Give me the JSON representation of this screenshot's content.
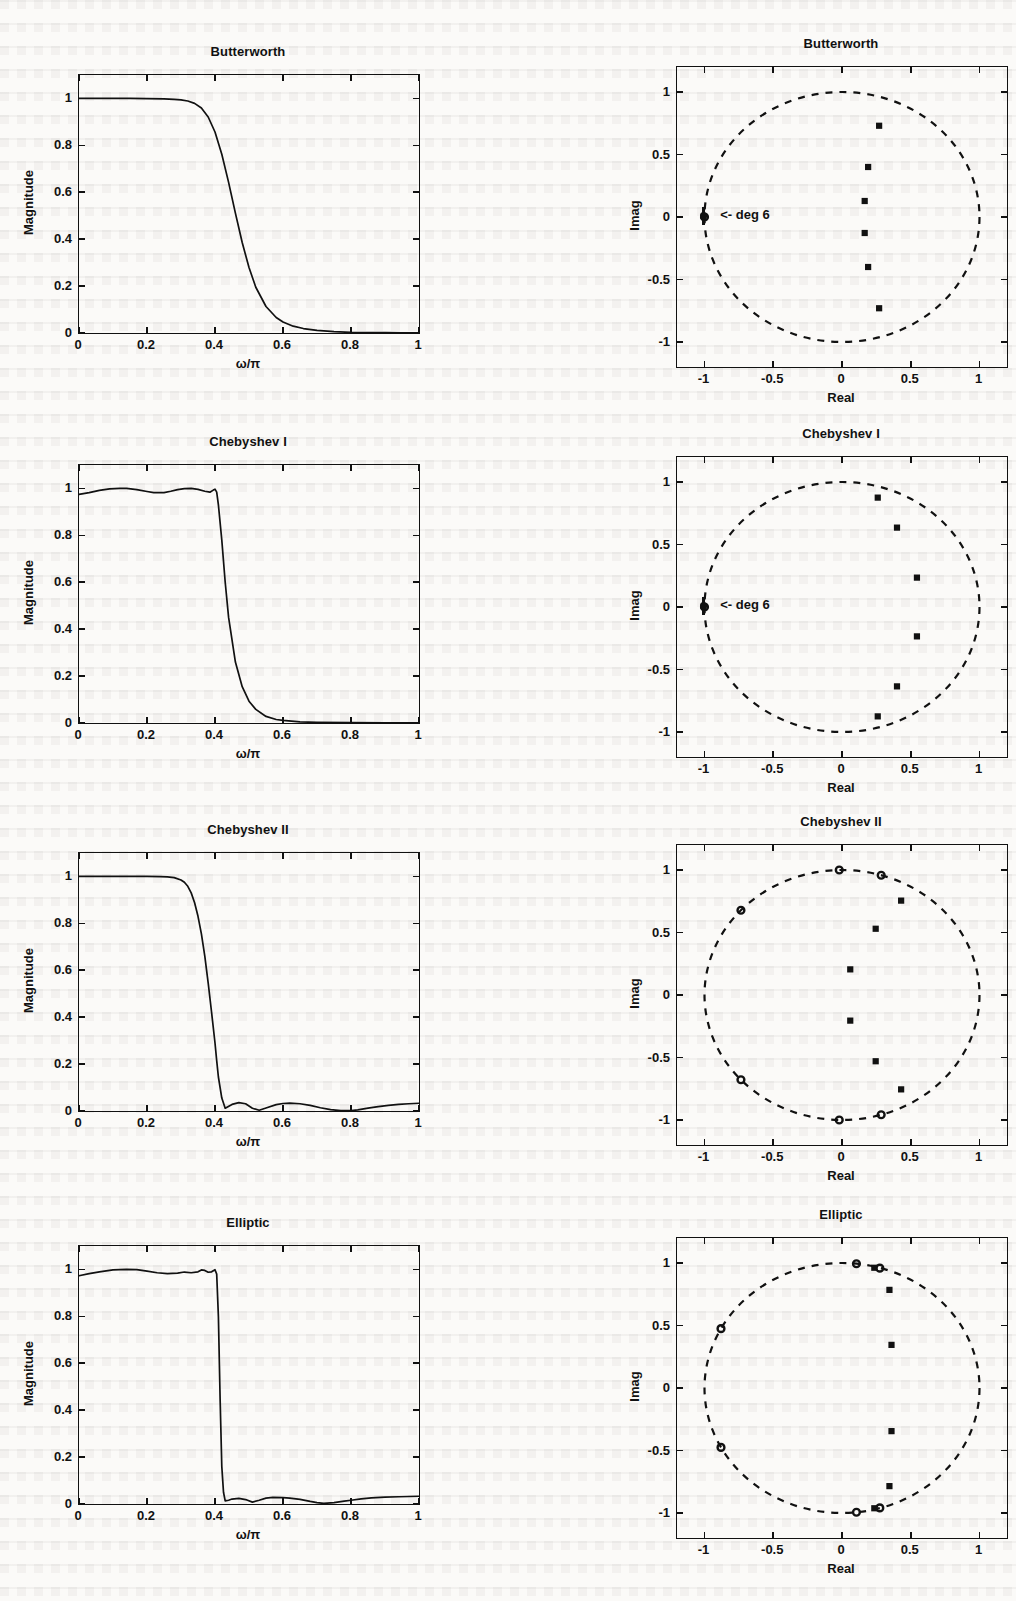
{
  "figure": {
    "kind": "filter-comparison-figure",
    "rows": 4,
    "cols": 2
  },
  "labels": {
    "magnitude_axis": "Magnitude",
    "omega_axis": "ω/π",
    "real_axis": "Real",
    "imag_axis": "Imag",
    "deg_annotation": "<- deg 6"
  },
  "chart_data": [
    {
      "type": "line",
      "title": "Butterworth",
      "panel": "magnitude",
      "xlabel": "ω/π",
      "ylabel": "Magnitude",
      "xlim": [
        0,
        1
      ],
      "ylim": [
        0,
        1.1
      ],
      "xticks": [
        "0",
        "0.2",
        "0.4",
        "0.6",
        "0.8",
        "1"
      ],
      "xtickvals": [
        0,
        0.2,
        0.4,
        0.6,
        0.8,
        1
      ],
      "yticks": [
        "0",
        "0.2",
        "0.4",
        "0.6",
        "0.8",
        "1"
      ],
      "ytickvals": [
        0,
        0.2,
        0.4,
        0.6,
        0.8,
        1
      ],
      "grid": false,
      "legend": "none",
      "x": [
        0,
        0.05,
        0.1,
        0.15,
        0.2,
        0.25,
        0.28,
        0.3,
        0.32,
        0.34,
        0.36,
        0.38,
        0.4,
        0.42,
        0.44,
        0.46,
        0.48,
        0.5,
        0.52,
        0.55,
        0.58,
        0.6,
        0.63,
        0.66,
        0.7,
        0.75,
        0.8,
        0.85,
        0.9,
        0.95,
        1
      ],
      "y": [
        1.0,
        1.0,
        1.0,
        1.0,
        0.999,
        0.998,
        0.996,
        0.994,
        0.989,
        0.979,
        0.959,
        0.921,
        0.857,
        0.762,
        0.642,
        0.511,
        0.386,
        0.279,
        0.195,
        0.113,
        0.066,
        0.047,
        0.029,
        0.019,
        0.011,
        0.006,
        0.003,
        0.002,
        0.002,
        0.001,
        0.001
      ]
    },
    {
      "type": "scatter",
      "title": "Butterworth",
      "panel": "pole-zero",
      "xlabel": "Real",
      "ylabel": "Imag",
      "xlim": [
        -1.2,
        1.2
      ],
      "ylim": [
        -1.2,
        1.2
      ],
      "xticks": [
        "-1",
        "-0.5",
        "0",
        "0.5",
        "1"
      ],
      "xtickvals": [
        -1,
        -0.5,
        0,
        0.5,
        1
      ],
      "yticks": [
        "1",
        "0.5",
        "0",
        "-0.5",
        "-1"
      ],
      "ytickvals": [
        1,
        0.5,
        0,
        -0.5,
        -1
      ],
      "unit_circle": true,
      "grid": false,
      "legend": "none",
      "annotation": "<- deg 6",
      "annotation_at": [
        -0.98,
        0.0
      ],
      "poles": [
        [
          0.27,
          0.73
        ],
        [
          0.27,
          -0.73
        ],
        [
          0.19,
          0.4
        ],
        [
          0.19,
          -0.4
        ],
        [
          0.165,
          0.128
        ],
        [
          0.165,
          -0.128
        ]
      ],
      "zeros": [
        [
          -1,
          0
        ]
      ],
      "zero_multiplicity": 6
    },
    {
      "type": "line",
      "title": "Chebyshev I",
      "panel": "magnitude",
      "xlabel": "ω/π",
      "ylabel": "Magnitude",
      "xlim": [
        0,
        1
      ],
      "ylim": [
        0,
        1.1
      ],
      "xticks": [
        "0",
        "0.2",
        "0.4",
        "0.6",
        "0.8",
        "1"
      ],
      "xtickvals": [
        0,
        0.2,
        0.4,
        0.6,
        0.8,
        1
      ],
      "yticks": [
        "0",
        "0.2",
        "0.4",
        "0.6",
        "0.8",
        "1"
      ],
      "ytickvals": [
        0,
        0.2,
        0.4,
        0.6,
        0.8,
        1
      ],
      "grid": false,
      "legend": "none",
      "x": [
        0,
        0.03,
        0.06,
        0.09,
        0.12,
        0.14,
        0.17,
        0.2,
        0.22,
        0.25,
        0.27,
        0.29,
        0.31,
        0.33,
        0.35,
        0.37,
        0.385,
        0.395,
        0.4,
        0.405,
        0.41,
        0.42,
        0.43,
        0.44,
        0.46,
        0.48,
        0.5,
        0.52,
        0.55,
        0.58,
        0.6,
        0.65,
        0.7,
        0.8,
        0.9,
        1
      ],
      "y": [
        0.975,
        0.982,
        0.992,
        0.998,
        1.0,
        1.0,
        0.995,
        0.987,
        0.982,
        0.982,
        0.988,
        0.995,
        0.999,
        1.0,
        0.996,
        0.988,
        0.984,
        0.993,
        0.997,
        0.984,
        0.93,
        0.78,
        0.6,
        0.45,
        0.26,
        0.155,
        0.093,
        0.058,
        0.028,
        0.015,
        0.011,
        0.005,
        0.003,
        0.002,
        0.001,
        0.001
      ]
    },
    {
      "type": "scatter",
      "title": "Chebyshev I",
      "panel": "pole-zero",
      "xlabel": "Real",
      "ylabel": "Imag",
      "xlim": [
        -1.2,
        1.2
      ],
      "ylim": [
        -1.2,
        1.2
      ],
      "xticks": [
        "-1",
        "-0.5",
        "0",
        "0.5",
        "1"
      ],
      "xtickvals": [
        -1,
        -0.5,
        0,
        0.5,
        1
      ],
      "yticks": [
        "1",
        "0.5",
        "0",
        "-0.5",
        "-1"
      ],
      "ytickvals": [
        1,
        0.5,
        0,
        -0.5,
        -1
      ],
      "unit_circle": true,
      "grid": false,
      "legend": "none",
      "annotation": "<- deg 6",
      "annotation_at": [
        -0.98,
        0.0
      ],
      "poles": [
        [
          0.26,
          0.875
        ],
        [
          0.26,
          -0.875
        ],
        [
          0.4,
          0.635
        ],
        [
          0.4,
          -0.635
        ],
        [
          0.545,
          0.235
        ],
        [
          0.545,
          -0.235
        ]
      ],
      "zeros": [
        [
          -1,
          0
        ]
      ],
      "zero_multiplicity": 6
    },
    {
      "type": "line",
      "title": "Chebyshev II",
      "panel": "magnitude",
      "xlabel": "ω/π",
      "ylabel": "Magnitude",
      "xlim": [
        0,
        1
      ],
      "ylim": [
        0,
        1.1
      ],
      "xticks": [
        "0",
        "0.2",
        "0.4",
        "0.6",
        "0.8",
        "1"
      ],
      "xtickvals": [
        0,
        0.2,
        0.4,
        0.6,
        0.8,
        1
      ],
      "yticks": [
        "0",
        "0.2",
        "0.4",
        "0.6",
        "0.8",
        "1"
      ],
      "ytickvals": [
        0,
        0.2,
        0.4,
        0.6,
        0.8,
        1
      ],
      "grid": false,
      "legend": "none",
      "x": [
        0,
        0.05,
        0.1,
        0.15,
        0.2,
        0.24,
        0.26,
        0.28,
        0.3,
        0.31,
        0.32,
        0.33,
        0.34,
        0.35,
        0.36,
        0.37,
        0.38,
        0.39,
        0.4,
        0.405,
        0.41,
        0.42,
        0.43,
        0.45,
        0.47,
        0.49,
        0.51,
        0.53,
        0.55,
        0.58,
        0.6,
        0.62,
        0.65,
        0.68,
        0.71,
        0.74,
        0.77,
        0.8,
        0.82,
        0.85,
        0.88,
        0.91,
        0.94,
        0.97,
        1
      ],
      "y": [
        1.0,
        1.0,
        1.0,
        1.0,
        1.0,
        0.999,
        0.998,
        0.995,
        0.985,
        0.975,
        0.958,
        0.93,
        0.888,
        0.83,
        0.755,
        0.66,
        0.545,
        0.42,
        0.29,
        0.215,
        0.145,
        0.055,
        0.012,
        0.028,
        0.036,
        0.031,
        0.012,
        0.003,
        0.013,
        0.027,
        0.032,
        0.034,
        0.031,
        0.024,
        0.014,
        0.006,
        0.002,
        0.002,
        0.005,
        0.012,
        0.019,
        0.024,
        0.028,
        0.031,
        0.033
      ]
    },
    {
      "type": "scatter",
      "title": "Chebyshev II",
      "panel": "pole-zero",
      "xlabel": "Real",
      "ylabel": "Imag",
      "xlim": [
        -1.2,
        1.2
      ],
      "ylim": [
        -1.2,
        1.2
      ],
      "xticks": [
        "-1",
        "-0.5",
        "0",
        "0.5",
        "1"
      ],
      "xtickvals": [
        -1,
        -0.5,
        0,
        0.5,
        1
      ],
      "yticks": [
        "1",
        "0.5",
        "0",
        "-0.5",
        "-1"
      ],
      "ytickvals": [
        1,
        0.5,
        0,
        -0.5,
        -1
      ],
      "unit_circle": true,
      "grid": false,
      "legend": "none",
      "poles": [
        [
          0.43,
          0.755
        ],
        [
          0.43,
          -0.755
        ],
        [
          0.245,
          0.53
        ],
        [
          0.245,
          -0.53
        ],
        [
          0.06,
          0.205
        ],
        [
          0.06,
          -0.205
        ]
      ],
      "zeros": [
        [
          -0.02,
          1.0
        ],
        [
          -0.02,
          -1.0
        ],
        [
          0.285,
          0.958
        ],
        [
          0.285,
          -0.958
        ],
        [
          -0.735,
          0.678
        ],
        [
          -0.735,
          -0.678
        ]
      ]
    },
    {
      "type": "line",
      "title": "Elliptic",
      "panel": "magnitude",
      "xlabel": "ω/π",
      "ylabel": "Magnitude",
      "xlim": [
        0,
        1
      ],
      "ylim": [
        0,
        1.1
      ],
      "xticks": [
        "0",
        "0.2",
        "0.4",
        "0.6",
        "0.8",
        "1"
      ],
      "xtickvals": [
        0,
        0.2,
        0.4,
        0.6,
        0.8,
        1
      ],
      "yticks": [
        "0",
        "0.2",
        "0.4",
        "0.6",
        "0.8",
        "1"
      ],
      "ytickvals": [
        0,
        0.2,
        0.4,
        0.6,
        0.8,
        1
      ],
      "grid": false,
      "legend": "none",
      "x": [
        0,
        0.03,
        0.06,
        0.1,
        0.14,
        0.17,
        0.2,
        0.23,
        0.26,
        0.29,
        0.31,
        0.33,
        0.35,
        0.36,
        0.37,
        0.38,
        0.39,
        0.4,
        0.405,
        0.41,
        0.415,
        0.42,
        0.425,
        0.43,
        0.44,
        0.45,
        0.47,
        0.49,
        0.51,
        0.53,
        0.55,
        0.57,
        0.6,
        0.62,
        0.65,
        0.68,
        0.7,
        0.72,
        0.75,
        0.78,
        0.8,
        0.83,
        0.86,
        0.9,
        0.94,
        0.97,
        1
      ],
      "y": [
        0.973,
        0.982,
        0.99,
        0.998,
        1.0,
        0.999,
        0.993,
        0.986,
        0.982,
        0.984,
        0.989,
        0.986,
        0.99,
        0.998,
        0.996,
        0.988,
        0.99,
        0.999,
        0.98,
        0.8,
        0.45,
        0.16,
        0.05,
        0.013,
        0.016,
        0.021,
        0.024,
        0.019,
        0.008,
        0.016,
        0.025,
        0.028,
        0.027,
        0.025,
        0.02,
        0.011,
        0.006,
        0.003,
        0.006,
        0.012,
        0.016,
        0.022,
        0.026,
        0.029,
        0.031,
        0.032,
        0.033
      ]
    },
    {
      "type": "scatter",
      "title": "Elliptic",
      "panel": "pole-zero",
      "xlabel": "Real",
      "ylabel": "Imag",
      "xlim": [
        -1.2,
        1.2
      ],
      "ylim": [
        -1.2,
        1.2
      ],
      "xticks": [
        "-1",
        "-0.5",
        "0",
        "0.5",
        "1"
      ],
      "xtickvals": [
        -1,
        -0.5,
        0,
        0.5,
        1
      ],
      "yticks": [
        "1",
        "0.5",
        "0",
        "-0.5",
        "-1"
      ],
      "ytickvals": [
        1,
        0.5,
        0,
        -0.5,
        -1
      ],
      "unit_circle": true,
      "grid": false,
      "legend": "none",
      "poles": [
        [
          0.345,
          0.785
        ],
        [
          0.345,
          -0.785
        ],
        [
          0.36,
          0.345
        ],
        [
          0.36,
          -0.345
        ],
        [
          0.235,
          0.962
        ],
        [
          0.235,
          -0.962
        ]
      ],
      "zeros": [
        [
          0.105,
          0.994
        ],
        [
          0.105,
          -0.994
        ],
        [
          0.275,
          0.959
        ],
        [
          0.275,
          -0.959
        ],
        [
          -0.88,
          0.475
        ],
        [
          -0.88,
          -0.475
        ]
      ]
    }
  ]
}
